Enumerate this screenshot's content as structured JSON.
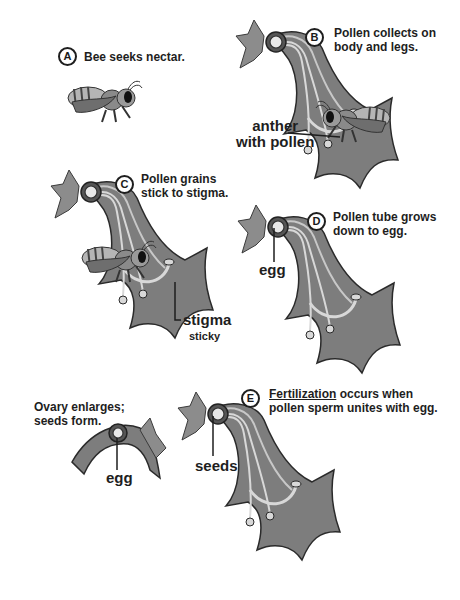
{
  "panels": {
    "A": {
      "letter": "A",
      "caption": "Bee seeks nectar."
    },
    "B": {
      "letter": "B",
      "caption_line1": "Pollen collects on",
      "caption_line2": "body and legs.",
      "label_line1": "anther",
      "label_line2": "with pollen"
    },
    "C": {
      "letter": "C",
      "caption_line1": "Pollen grains",
      "caption_line2": "stick to stigma.",
      "label": "stigma",
      "sublabel": "sticky"
    },
    "D": {
      "letter": "D",
      "caption_line1": "Pollen tube grows",
      "caption_line2": "down to egg.",
      "label": "egg"
    },
    "E": {
      "letter": "E",
      "caption_term": "Fertilization",
      "caption_rest1": " occurs when",
      "caption_line2": "pollen sperm unites with egg.",
      "label": "seeds"
    },
    "ovary": {
      "caption_line1": "Ovary enlarges;",
      "caption_line2": "seeds form.",
      "label": "egg"
    }
  },
  "colors": {
    "flower_fill": "#7a7a7a",
    "flower_light": "#a6a6a6",
    "outline": "#2a2a2a",
    "stamen": "#d8d8d8",
    "text": "#1e1e1e"
  }
}
